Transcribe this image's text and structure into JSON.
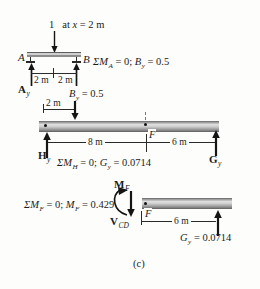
{
  "caption": "(c)",
  "colors": {
    "ink": "#1c1c1c",
    "beam_fill": "#c9c9c9",
    "beam_edge": "#5f5f5f",
    "background": "#fdfdfb"
  },
  "top": {
    "load_value": "1",
    "load_text": [
      "at ",
      "x",
      " = 2 m"
    ],
    "node_a": "A",
    "node_b": "B",
    "dim_left": "2 m",
    "dim_right": "2 m",
    "reaction_left": [
      "A",
      "y"
    ],
    "equation": [
      "ΣM",
      "A",
      " = 0; ",
      "B",
      "y",
      " = 0.5"
    ]
  },
  "middle": {
    "applied_load": [
      "B",
      "y",
      " = 0.5"
    ],
    "offset_dim": "2 m",
    "span_left": "8 m",
    "span_right": "6 m",
    "point_label": "F",
    "reaction_left": [
      "H",
      "y"
    ],
    "reaction_right": [
      "G",
      "y"
    ],
    "equation": [
      "ΣM",
      "H",
      " = 0; ",
      "G",
      "y",
      " = 0.0714"
    ]
  },
  "bottom": {
    "moment_label": [
      "M",
      "F"
    ],
    "shear_label": [
      "V",
      "CD"
    ],
    "point_label": "F",
    "span": "6 m",
    "reaction_right": [
      "G",
      "y",
      " = 0.0714"
    ],
    "equation": [
      "ΣM",
      "F",
      " = 0; ",
      "M",
      "F",
      " = 0.429"
    ]
  }
}
